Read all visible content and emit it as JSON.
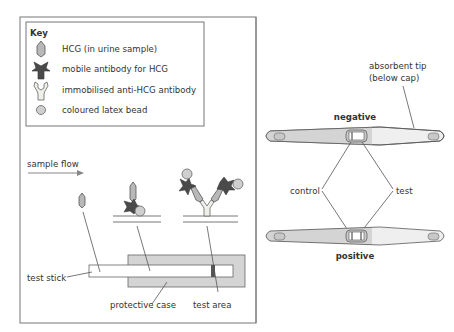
{
  "key": {
    "title": "Key",
    "items": [
      {
        "icon": "hcg-icon",
        "label": "HCG (in urine sample)"
      },
      {
        "icon": "mobile-antibody-icon",
        "label": "mobile antibody for HCG"
      },
      {
        "icon": "immobilised-antibody-icon",
        "label": "immobilised anti-HCG antibody"
      },
      {
        "icon": "latex-bead-icon",
        "label": "coloured latex bead"
      }
    ]
  },
  "left_panel": {
    "flow_label": "sample flow",
    "labels": {
      "test_stick": "test stick",
      "protective_case": "protective case",
      "test_area": "test area"
    }
  },
  "right_panel": {
    "absorbent_tip_line1": "absorbent tip",
    "absorbent_tip_line2": "(below cap)",
    "negative": "negative",
    "positive": "positive",
    "control": "control",
    "test": "test"
  },
  "colors": {
    "outline": "#555555",
    "hcg": "#b8b8b8",
    "mobile_antibody": "#4a4a4a",
    "immobilised_antibody": "#f0f0ea",
    "bead": "#cfcfcf",
    "case": "#d4d4d4",
    "stick_body": "#dcdcdc",
    "stick_tip": "#efefef"
  }
}
